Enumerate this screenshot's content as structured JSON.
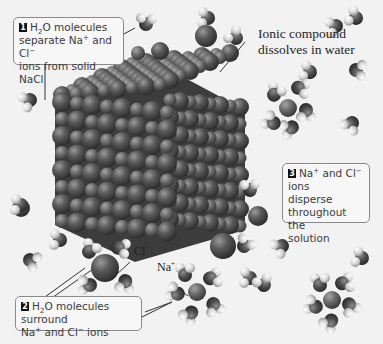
{
  "diagram": {
    "title_label": "Ionic compound dissolves in water",
    "title_line1": "Ionic compound",
    "title_line2": "dissolves in water",
    "steps": [
      {
        "number": "1",
        "text": "H2O molecules separate Na+ and Cl- ions from solid NaCl",
        "line1_a": "H",
        "line1_sub": "2",
        "line1_b": "O molecules",
        "line2_a": "separate Na",
        "line2_sup1": "+",
        "line2_b": " and Cl",
        "line2_sup2": "−",
        "line3": "ions from solid NaCl"
      },
      {
        "number": "2",
        "text": "H2O molecules surround Na+ and Cl- ions",
        "line1_a": "H",
        "line1_sub": "2",
        "line1_b": "O molecules surround",
        "line2_a": "Na",
        "line2_sup1": "+",
        "line2_b": " and Cl",
        "line2_sup2": "−",
        "line2_c": " ions"
      },
      {
        "number": "3",
        "text": "Na+ and Cl- ions disperse throughout the solution",
        "line1_a": "Na",
        "line1_sup1": "+",
        "line1_b": " and Cl",
        "line1_sup2": "−",
        "line1_c": " ions",
        "line2": "disperse",
        "line3": "throughout the",
        "line4": "solution"
      }
    ],
    "ion_labels": {
      "chloride_base": "Cl",
      "chloride_charge": "−",
      "sodium_base": "Na",
      "sodium_charge": "+"
    },
    "colors": {
      "background": "#f2f2f2",
      "ion_dark": "#4a4a4a",
      "ion_light": "#6e6e6e",
      "hydrogen": "#e8e8e8",
      "oxygen": "#505050",
      "callout_border": "#8a8a8a",
      "step_badge": "#111111"
    }
  }
}
